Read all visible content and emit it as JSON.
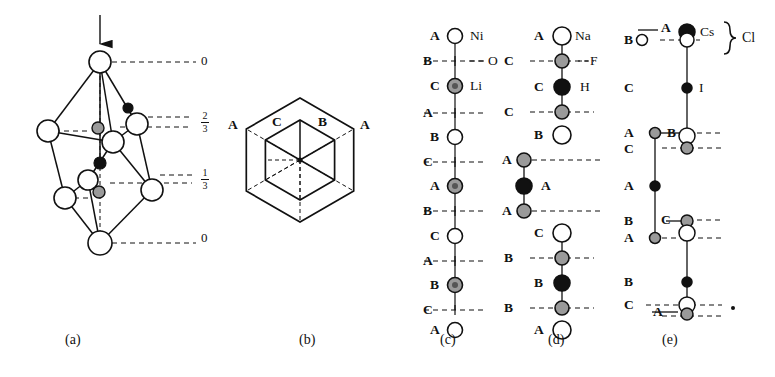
{
  "figure": {
    "type": "crystal-structure-diagram",
    "panels": [
      "(a)",
      "(b)",
      "(c)",
      "(d)",
      "(e)"
    ],
    "caption_labels": [
      {
        "text": "(a)",
        "x": 73,
        "y": 340
      },
      {
        "text": "(b)",
        "x": 307,
        "y": 340
      },
      {
        "text": "(c)",
        "x": 448,
        "y": 340
      },
      {
        "text": "(d)",
        "x": 556,
        "y": 340
      },
      {
        "text": "(e)",
        "x": 670,
        "y": 340
      }
    ]
  },
  "panel_a": {
    "name": "rhombohedral-unit-cell",
    "arrow": {
      "label": "c-axis-arrow",
      "x": 100,
      "y_top": 15,
      "y_bottom": 56
    },
    "level_labels": [
      {
        "text": "0",
        "kind": "integer",
        "x": 203,
        "y": 62
      },
      {
        "text": "2/3",
        "kind": "fraction",
        "numerator": "2",
        "denominator": "3",
        "x": 200,
        "y": 122
      },
      {
        "text": "1/3",
        "kind": "fraction",
        "numerator": "1",
        "denominator": "3",
        "x": 200,
        "y": 178
      },
      {
        "text": "0",
        "kind": "integer",
        "x": 203,
        "y": 239
      }
    ],
    "atoms_open": [
      {
        "x": 100,
        "y": 62,
        "r": 11
      },
      {
        "x": 48,
        "y": 131,
        "r": 11
      },
      {
        "x": 137,
        "y": 124,
        "r": 11
      },
      {
        "x": 113,
        "y": 142,
        "r": 11
      },
      {
        "x": 88,
        "y": 180,
        "r": 10
      },
      {
        "x": 65,
        "y": 198,
        "r": 11
      },
      {
        "x": 152,
        "y": 190,
        "r": 11
      },
      {
        "x": 100,
        "y": 243,
        "r": 12
      }
    ],
    "atoms_gray": [
      {
        "x": 98,
        "y": 128,
        "r": 6
      },
      {
        "x": 99,
        "y": 192,
        "r": 6
      }
    ],
    "atoms_black": [
      {
        "x": 128,
        "y": 108,
        "r": 5
      },
      {
        "x": 100,
        "y": 163,
        "r": 6
      }
    ]
  },
  "panel_b": {
    "name": "hexagonal-projection",
    "center": {
      "x": 300,
      "y": 160
    },
    "outer_hexagon_radius": 62,
    "inner_hexagon_radius": 40,
    "corner_labels": [
      {
        "text": "A",
        "x": 232,
        "y": 125
      },
      {
        "text": "C",
        "x": 276,
        "y": 122
      },
      {
        "text": "B",
        "x": 322,
        "y": 122
      },
      {
        "text": "A",
        "x": 364,
        "y": 125
      }
    ]
  },
  "panel_c": {
    "name": "stacking-sequence-lini02",
    "axis_x": 455,
    "species": [
      {
        "symbol": "Ni",
        "marker": "open-circle",
        "x": 478,
        "y": 36
      },
      {
        "symbol": "O",
        "marker": "dashed-line",
        "x": 490,
        "y": 61
      },
      {
        "symbol": "Li",
        "marker": "gray-circle",
        "x": 480,
        "y": 86
      }
    ],
    "rows": [
      {
        "label": "A",
        "marker": "open-circle",
        "label_x": 410,
        "y": 36
      },
      {
        "label": "B",
        "marker": "dashed-line",
        "label_x": 403,
        "y": 61
      },
      {
        "label": "C",
        "marker": "gray-circle",
        "label_x": 410,
        "y": 86
      },
      {
        "label": "A",
        "marker": "dashed-line",
        "label_x": 403,
        "y": 113
      },
      {
        "label": "B",
        "marker": "open-circle",
        "label_x": 410,
        "y": 137
      },
      {
        "label": "C",
        "marker": "dashed-line",
        "label_x": 403,
        "y": 162
      },
      {
        "label": "A",
        "marker": "gray-circle",
        "label_x": 410,
        "y": 186
      },
      {
        "label": "B",
        "marker": "dashed-line",
        "label_x": 403,
        "y": 211
      },
      {
        "label": "C",
        "marker": "open-circle",
        "label_x": 410,
        "y": 236
      },
      {
        "label": "A",
        "marker": "dashed-line",
        "label_x": 403,
        "y": 261
      },
      {
        "label": "B",
        "marker": "gray-circle",
        "label_x": 410,
        "y": 285
      },
      {
        "label": "C",
        "marker": "dashed-line",
        "label_x": 403,
        "y": 310
      },
      {
        "label": "A",
        "marker": "open-circle",
        "label_x": 410,
        "y": 309
      }
    ]
  },
  "panel_d": {
    "name": "stacking-sequence-nahf2",
    "axis_x": 562,
    "offset_axis_x": 524,
    "species": [
      {
        "symbol": "Na",
        "marker": "open-circle",
        "x": 583,
        "y": 36
      },
      {
        "symbol": "F",
        "marker": "gray-circle",
        "x": 592,
        "y": 61
      },
      {
        "symbol": "H",
        "marker": "black-circle",
        "x": 586,
        "y": 87
      }
    ],
    "rows": [
      {
        "label": "A",
        "marker": "open-circle",
        "label_x": 538,
        "y": 36
      },
      {
        "label": "C",
        "marker": "gray-circle",
        "label_x": 508,
        "y": 61
      },
      {
        "label": "C",
        "marker": "black-circle",
        "label_x": 538,
        "y": 87
      },
      {
        "label": "C",
        "marker": "gray-circle",
        "label_x": 508,
        "y": 112
      },
      {
        "label": "B",
        "marker": "open-circle",
        "label_x": 538,
        "y": 135
      },
      {
        "label": "A",
        "marker": "gray-circle",
        "label_x": 506,
        "y": 160
      },
      {
        "label": "A",
        "marker": "black-circle",
        "label_x": 545,
        "y": 186
      },
      {
        "label": "A",
        "marker": "gray-circle",
        "label_x": 506,
        "y": 211
      },
      {
        "label": "C",
        "marker": "open-circle",
        "label_x": 538,
        "y": 233
      },
      {
        "label": "B",
        "marker": "gray-circle",
        "label_x": 508,
        "y": 258
      },
      {
        "label": "B",
        "marker": "black-circle",
        "label_x": 538,
        "y": 283
      },
      {
        "label": "B",
        "marker": "gray-circle",
        "label_x": 508,
        "y": 308
      },
      {
        "label": "A",
        "marker": "open-circle",
        "label_x": 538,
        "y": 310
      }
    ]
  },
  "panel_e": {
    "name": "stacking-sequence-cscl-i",
    "axis_x": 687,
    "offset_axis_x": 655,
    "brace_label": "Cl",
    "species": [
      {
        "symbol": "Cs",
        "marker": "black-circle",
        "x": 706,
        "y": 32
      },
      {
        "symbol": "I",
        "marker": "black-circle",
        "x": 703,
        "y": 88
      }
    ],
    "rows": [
      {
        "label": "B",
        "marker": "open-circle",
        "label_x": 628,
        "y": 40
      },
      {
        "label": "A",
        "marker": "black-circle",
        "label_x": 664,
        "y": 28
      },
      {
        "label": "C",
        "marker": "black-circle",
        "label_x": 628,
        "y": 88
      },
      {
        "label": "A",
        "marker": "gray-circle",
        "label_x": 628,
        "y": 133
      },
      {
        "label": "B",
        "marker": "open-circle",
        "label_x": 670,
        "y": 133
      },
      {
        "label": "C",
        "marker": "gray-circle",
        "label_x": 628,
        "y": 148
      },
      {
        "label": "A",
        "marker": "black-circle",
        "label_x": 628,
        "y": 186
      },
      {
        "label": "B",
        "marker": "gray-circle",
        "label_x": 628,
        "y": 221
      },
      {
        "label": "C",
        "marker": "open-circle",
        "label_x": 664,
        "y": 220
      },
      {
        "label": "A",
        "marker": "gray-circle",
        "label_x": 628,
        "y": 238
      },
      {
        "label": "B",
        "marker": "black-circle",
        "label_x": 628,
        "y": 282
      },
      {
        "label": "C",
        "marker": "open-circle",
        "label_x": 628,
        "y": 305
      },
      {
        "label": "A",
        "marker": "gray-circle",
        "label_x": 656,
        "y": 312
      }
    ]
  },
  "colors": {
    "line": "#111111",
    "gray_fill": "#9a9a9a",
    "black_fill": "#111111",
    "open_fill": "#ffffff",
    "background": "#ffffff"
  }
}
